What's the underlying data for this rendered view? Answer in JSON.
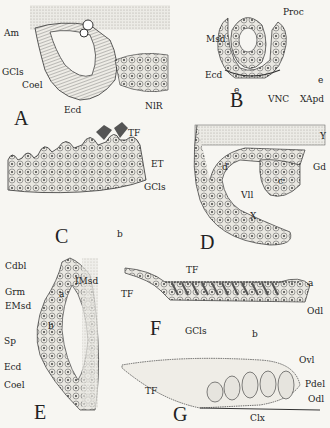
{
  "figure": {
    "panels": [
      {
        "id": "A",
        "labels": [
          "Am",
          "GCls",
          "Coel",
          "Ecd",
          "NlR"
        ]
      },
      {
        "id": "B",
        "labels": [
          "Proc",
          "Msd",
          "Ecd",
          "e",
          "VNC",
          "e",
          "XApd"
        ]
      },
      {
        "id": "C",
        "labels": [
          "TF",
          "ET",
          "GCls",
          "b"
        ]
      },
      {
        "id": "D",
        "labels": [
          "Y",
          "d",
          "Gd",
          "c",
          "Vll",
          "X"
        ]
      },
      {
        "id": "E",
        "labels": [
          "Cdbl",
          "IMsd",
          "Grm",
          "a",
          "EMsd",
          "b",
          "Sp",
          "Ecd",
          "Coel"
        ]
      },
      {
        "id": "F",
        "labels": [
          "TF",
          "TF",
          "a",
          "Odl",
          "GCls",
          "b"
        ]
      },
      {
        "id": "G",
        "labels": [
          "Ovl",
          "TF",
          "Pdel",
          "Odl",
          "Clx"
        ]
      }
    ]
  },
  "A": {
    "letter": "A",
    "am": "Am",
    "gcls": "GCls",
    "coel": "Coel",
    "ecd": "Ecd",
    "nlr": "NlR"
  },
  "B": {
    "letter": "B",
    "proc": "Proc",
    "msd": "Msd",
    "ecd": "Ecd",
    "e1": "e",
    "vnc": "VNC",
    "e2": "e",
    "xapd": "XApd"
  },
  "C": {
    "letter": "C",
    "tf": "TF",
    "et": "ET",
    "gcls": "GCls",
    "b": "b"
  },
  "D": {
    "letter": "D",
    "y": "Y",
    "d": "d",
    "gd": "Gd",
    "c": "c",
    "vll": "Vll",
    "x": "X"
  },
  "E": {
    "letter": "E",
    "cdbl": "Cdbl",
    "imsd": "IMsd",
    "grm": "Grm",
    "a": "a",
    "emsd": "EMsd",
    "b": "b",
    "sp": "Sp",
    "ecd": "Ecd",
    "coel": "Coel"
  },
  "F": {
    "letter": "F",
    "tf1": "TF",
    "tf2": "TF",
    "a": "a",
    "odl": "Odl",
    "gcls": "GCls",
    "b": "b"
  },
  "G": {
    "letter": "G",
    "ovl": "Ovl",
    "tf": "TF",
    "pdel": "Pdel",
    "odl": "Odl",
    "clx": "Clx"
  }
}
